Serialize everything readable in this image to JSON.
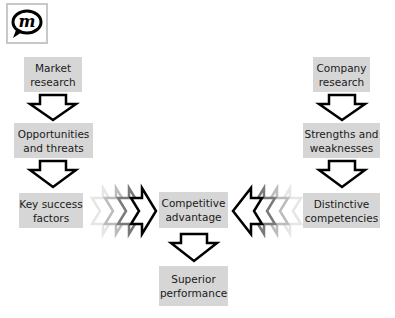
{
  "logo": {
    "icon": "m-speech-bubble-logo",
    "letter": "m"
  },
  "diagram": {
    "title": "",
    "left_column": [
      {
        "id": "market-research",
        "label": "Market\nresearch"
      },
      {
        "id": "opportunities-threats",
        "label": "Opportunities\nand threats"
      },
      {
        "id": "key-success-factors",
        "label": "Key success\nfactors"
      }
    ],
    "right_column": [
      {
        "id": "company-research",
        "label": "Company\nresearch"
      },
      {
        "id": "strengths-weaknesses",
        "label": "Strengths and\nweaknesses"
      },
      {
        "id": "distinctive-competencies",
        "label": "Distinctive\ncompetencies"
      }
    ],
    "center": [
      {
        "id": "competitive-advantage",
        "label": "Competitive\nadvantage"
      },
      {
        "id": "superior-performance",
        "label": "Superior\nperformance"
      }
    ],
    "colors": {
      "box_fill": "#d6d6d6",
      "arrow_stroke": "#000000",
      "chevron_fades": [
        "#e4e4e4",
        "#b8b8b8",
        "#7a7a7a",
        "#000000"
      ]
    }
  }
}
